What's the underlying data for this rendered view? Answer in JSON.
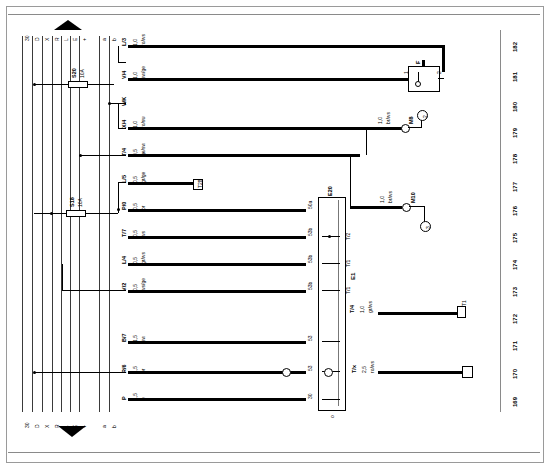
{
  "sheet": {
    "title": "Current Flow Diagram",
    "orientation": "rotated-90"
  },
  "bus_bars": {
    "left_group_labels_top": [
      "30",
      "D",
      "X",
      "R",
      "L",
      "E",
      "+"
    ],
    "left_group_labels_bottom": [
      "30",
      "D",
      "X",
      "R",
      "L",
      "E",
      "+"
    ],
    "right_group_labels_top": [
      "a",
      "b"
    ],
    "right_group_labels_bottom": [
      "a",
      "b"
    ]
  },
  "arrows": {
    "top": "flow-up",
    "bottom": "flow-down"
  },
  "fuses": [
    {
      "id": "S20",
      "rating": "10A",
      "x": 80,
      "y": 78
    },
    {
      "id": "S18",
      "rating": "10A",
      "x": 78,
      "y": 210
    }
  ],
  "wires": [
    {
      "terminal": "1,0",
      "gauge": "1,0",
      "color": "ro/ws",
      "pin": "L/3",
      "y": 46
    },
    {
      "terminal": "1,0",
      "gauge": "1,0",
      "color": "sw/ge",
      "pin": "V/4",
      "y": 78
    },
    {
      "terminal": "",
      "gauge": "",
      "color": "",
      "pin": "WK",
      "y": 103
    },
    {
      "terminal": "1,0",
      "gauge": "1,0",
      "color": "ro/sw",
      "pin": "X/4",
      "y": 128
    },
    {
      "terminal": "0,5",
      "gauge": "0,5",
      "color": "ge/sw",
      "pin": "T/4",
      "y": 155
    },
    {
      "terminal": "0,5",
      "gauge": "0,5",
      "color": "gr/ge",
      "pin": "L/5",
      "y": 182
    },
    {
      "terminal": "0,5",
      "gauge": "0,5",
      "color": "br",
      "pin": "P/0",
      "y": 209
    },
    {
      "terminal": "0,5",
      "gauge": "0,5",
      "color": "ws",
      "pin": "T/7",
      "y": 236
    },
    {
      "terminal": "0,5",
      "gauge": "0,5",
      "color": "gr/ws",
      "pin": "L/4",
      "y": 263
    },
    {
      "terminal": "0,5",
      "gauge": "0,5",
      "color": "ws/ge",
      "pin": "V/2",
      "y": 290
    },
    {
      "terminal": "1,5",
      "gauge": "1,5",
      "color": "sw",
      "pin": "B/7",
      "y": 341
    },
    {
      "terminal": "1,5",
      "gauge": "1,5",
      "color": "br",
      "pin": "R/6",
      "y": 372
    },
    {
      "terminal": "1,5",
      "gauge": "1,5",
      "color": "e",
      "pin": "P",
      "y": 399
    }
  ],
  "switch_block": {
    "id": "E1",
    "top_terminal": "E20",
    "pins_left": [
      "50a",
      "53b",
      "53b",
      "53b",
      "53",
      "53",
      "30"
    ],
    "pins_right": [
      "53b",
      "T/2",
      "T/1",
      "T/1",
      "T/2",
      "T/4",
      "T/x"
    ],
    "bottom_label": "o"
  },
  "switch_f": {
    "id": "F",
    "pin_left": "1",
    "pin_right": "2"
  },
  "grounds": [
    {
      "gauge": "1,0",
      "color": "br/ws",
      "label": "M8",
      "ref": "2",
      "x": 405,
      "y": 125
    },
    {
      "gauge": "1,0",
      "color": "br/ws",
      "label": "M10",
      "ref": "3",
      "x": 410,
      "y": 205
    }
  ],
  "branch_wires": [
    {
      "gauge": "1,0",
      "color": "gr/ws",
      "pin": "T/4",
      "y": 312
    },
    {
      "gauge": "2,5",
      "color": "ro/ws",
      "pin": "T/x",
      "y": 372
    }
  ],
  "connectors_right": [
    {
      "id": "T1",
      "y": 312
    },
    {
      "id": "T2",
      "y": 369
    }
  ],
  "small_component": {
    "label": "T28",
    "x": 196,
    "y": 184
  },
  "track_numbers": [
    "182",
    "181",
    "180",
    "179",
    "178",
    "177",
    "176",
    "175",
    "174",
    "173",
    "172",
    "171",
    "170",
    "169"
  ],
  "track_positions": [
    45,
    75,
    105,
    131,
    157,
    185,
    209,
    236,
    263,
    290,
    317,
    344,
    372,
    400
  ]
}
